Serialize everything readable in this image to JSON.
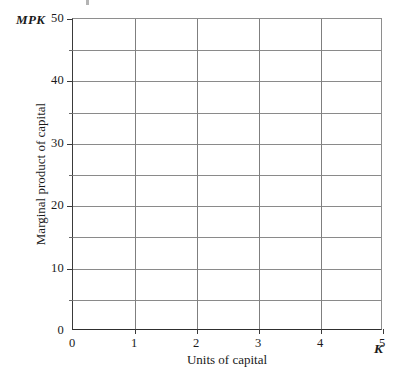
{
  "chart_data": {
    "type": "line",
    "title": "",
    "subtitle": "",
    "xlabel": "Units of capital",
    "ylabel": "Marginal product of capital",
    "x_symbol": "K",
    "y_symbol": "MPK",
    "xlim": [
      0,
      5
    ],
    "ylim": [
      0,
      50
    ],
    "x_ticks": [
      0,
      1,
      2,
      3,
      4,
      5
    ],
    "x_tick_labels": [
      "0",
      "1",
      "2",
      "3",
      "4",
      "5"
    ],
    "y_ticks": [
      0,
      10,
      20,
      30,
      40,
      50
    ],
    "y_tick_labels": [
      "0",
      "10",
      "20",
      "30",
      "40",
      "50"
    ],
    "y_minor_ticks": [
      5,
      15,
      25,
      35,
      45
    ],
    "x_gridlines": [
      1,
      2,
      3,
      4
    ],
    "y_gridlines": [
      5,
      10,
      15,
      20,
      25,
      30,
      35,
      40,
      45
    ],
    "grid": true,
    "legend": null,
    "series": [],
    "annotations": [],
    "note": "Empty plotting grid; no data series are drawn."
  },
  "style": {
    "background": "#ffffff",
    "gridline_color": "#8a8a8a",
    "axis_color": "#2e2e2e",
    "text_color": "#1a1a1a"
  }
}
